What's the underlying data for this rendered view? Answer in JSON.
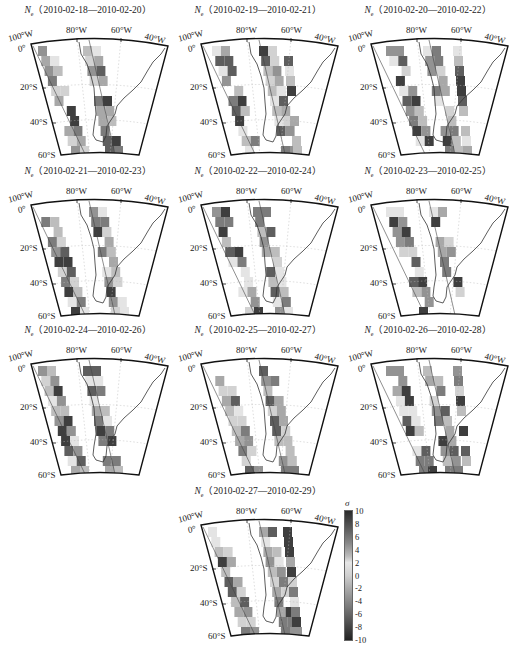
{
  "chart_data": {
    "type": "heatmap",
    "variable": "N_e",
    "map_extent": {
      "lon_range": [
        -100,
        -40
      ],
      "lat_range": [
        -60,
        0
      ]
    },
    "lon_tick_labels": [
      "100°W",
      "80°W",
      "60°W",
      "40°W"
    ],
    "lat_tick_labels": [
      "0°",
      "20°S",
      "40°S",
      "60°S"
    ],
    "panels": [
      {
        "title_var": "N",
        "title_sub": "e",
        "title_range": "（2010-02-18—2010-02-20）"
      },
      {
        "title_var": "N",
        "title_sub": "e",
        "title_range": "（2010-02-19—2010-02-21）"
      },
      {
        "title_var": "N",
        "title_sub": "e",
        "title_range": "（2010-02-20—2010-02-22）"
      },
      {
        "title_var": "N",
        "title_sub": "e",
        "title_range": "（2010-02-21—2010-02-23）"
      },
      {
        "title_var": "N",
        "title_sub": "e",
        "title_range": "（2010-02-22—2010-02-24）"
      },
      {
        "title_var": "N",
        "title_sub": "e",
        "title_range": "（2010-02-23—2010-02-25）"
      },
      {
        "title_var": "N",
        "title_sub": "e",
        "title_range": "（2010-02-24—2010-02-26）"
      },
      {
        "title_var": "N",
        "title_sub": "e",
        "title_range": "（2010-02-25—2010-02-27）"
      },
      {
        "title_var": "N",
        "title_sub": "e",
        "title_range": "（2010-02-26—2010-02-28）"
      },
      {
        "title_var": "N",
        "title_sub": "e",
        "title_range": "（2010-02-27—2010-02-29）"
      }
    ],
    "colorbar": {
      "label": "σ",
      "ticks": [
        "10",
        "8",
        "6",
        "4",
        "2",
        "0",
        "-2",
        "-4",
        "-6",
        "-8",
        "-10"
      ],
      "range": [
        -10,
        10
      ],
      "colormap": "grayscale (dark at extremes, light near 2)"
    }
  }
}
